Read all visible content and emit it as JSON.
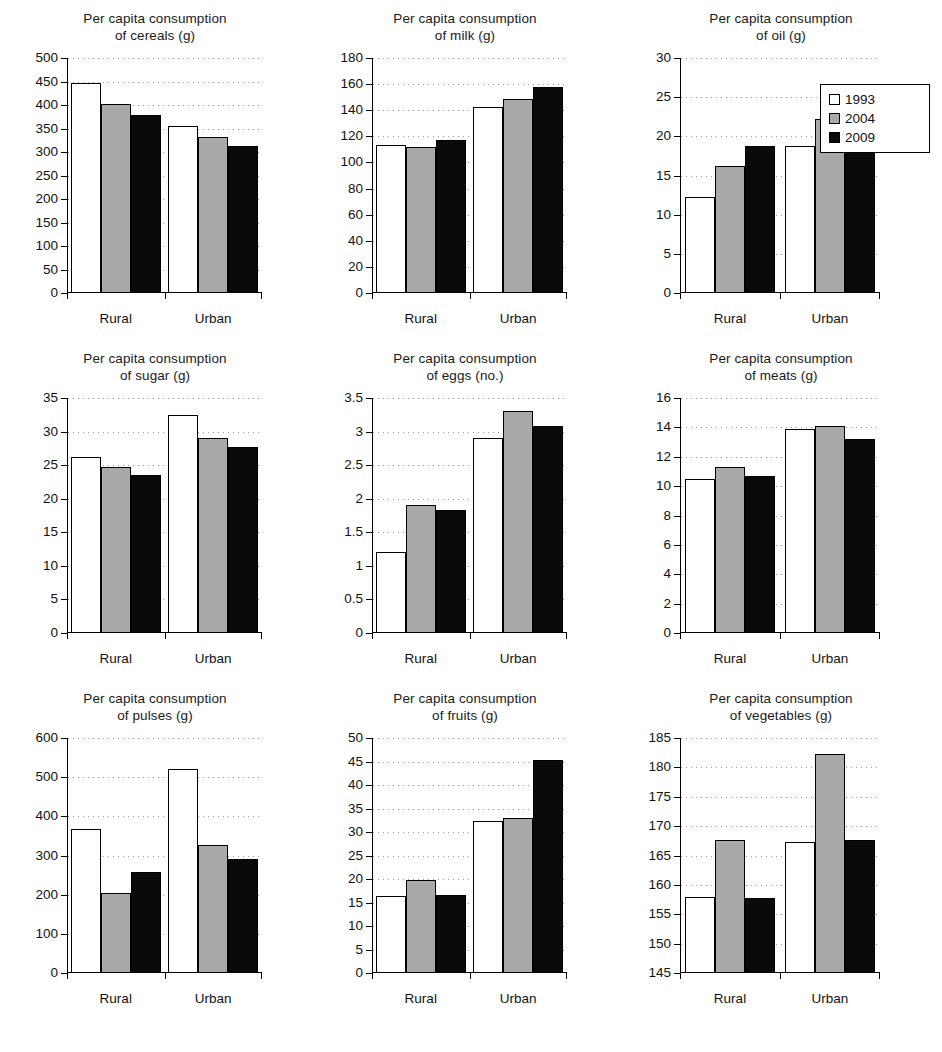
{
  "figure": {
    "series_colors": {
      "1993": "#ffffff",
      "2004": "#a9a9a9",
      "2009": "#0a0a0a"
    },
    "legend": {
      "position": "top-right",
      "entries": [
        {
          "label": "1993",
          "swatch": "white-square"
        },
        {
          "label": "2004",
          "swatch": "gray-square"
        },
        {
          "label": "2009",
          "swatch": "black-square"
        }
      ]
    },
    "caption_partial": "truncated caption text clipped at bottom edge"
  },
  "chart_data": [
    {
      "id": "cereals",
      "type": "bar",
      "title": "Per capita consumption of cereals (g)",
      "title_line1": "Per capita consumption",
      "title_line2": "of cereals (g)",
      "categories": [
        "Rural",
        "Urban"
      ],
      "series": [
        {
          "name": "1993",
          "values": [
            447,
            355
          ]
        },
        {
          "name": "2004",
          "values": [
            403,
            331
          ]
        },
        {
          "name": "2009",
          "values": [
            378,
            313
          ]
        }
      ],
      "ylim": [
        0,
        500
      ],
      "yticks": [
        0,
        50,
        100,
        150,
        200,
        250,
        300,
        350,
        400,
        450,
        500
      ],
      "xlabel": "",
      "ylabel": "",
      "grid": true
    },
    {
      "id": "milk",
      "type": "bar",
      "title": "Per capita consumption of milk (g)",
      "title_line1": "Per capita consumption",
      "title_line2": "of milk (g)",
      "categories": [
        "Rural",
        "Urban"
      ],
      "series": [
        {
          "name": "1993",
          "values": [
            113,
            142.5
          ]
        },
        {
          "name": "2004",
          "values": [
            111.5,
            148.5
          ]
        },
        {
          "name": "2009",
          "values": [
            117.5,
            158
          ]
        }
      ],
      "ylim": [
        0,
        180
      ],
      "yticks": [
        0,
        20,
        40,
        60,
        80,
        100,
        120,
        140,
        160,
        180
      ],
      "xlabel": "",
      "ylabel": "",
      "grid": true
    },
    {
      "id": "oil",
      "type": "bar",
      "title": "Per capita consumption of oil (g)",
      "title_line1": "Per capita consumption",
      "title_line2": "of oil (g)",
      "categories": [
        "Rural",
        "Urban"
      ],
      "series": [
        {
          "name": "1993",
          "values": [
            12.3,
            18.8
          ]
        },
        {
          "name": "2004",
          "values": [
            16.2,
            22.2
          ]
        },
        {
          "name": "2009",
          "values": [
            18.8,
            24.0
          ]
        }
      ],
      "ylim": [
        0,
        30
      ],
      "yticks": [
        0,
        5,
        10,
        15,
        20,
        25,
        30
      ],
      "xlabel": "",
      "ylabel": "",
      "grid": true
    },
    {
      "id": "sugar",
      "type": "bar",
      "title": "Per capita consumption of sugar (g)",
      "title_line1": "Per capita consumption",
      "title_line2": "of sugar (g)",
      "categories": [
        "Rural",
        "Urban"
      ],
      "series": [
        {
          "name": "1993",
          "values": [
            26.2,
            32.4
          ]
        },
        {
          "name": "2004",
          "values": [
            24.7,
            29.0
          ]
        },
        {
          "name": "2009",
          "values": [
            23.5,
            27.7
          ]
        }
      ],
      "ylim": [
        0,
        35
      ],
      "yticks": [
        0,
        5,
        10,
        15,
        20,
        25,
        30,
        35
      ],
      "xlabel": "",
      "ylabel": "",
      "grid": true
    },
    {
      "id": "eggs",
      "type": "bar",
      "title": "Per capita consumption of eggs (no.)",
      "title_line1": "Per capita consumption",
      "title_line2": "of eggs (no.)",
      "categories": [
        "Rural",
        "Urban"
      ],
      "series": [
        {
          "name": "1993",
          "values": [
            1.2,
            2.9
          ]
        },
        {
          "name": "2004",
          "values": [
            1.9,
            3.3
          ]
        },
        {
          "name": "2009",
          "values": [
            1.83,
            3.08
          ]
        }
      ],
      "ylim": [
        0,
        3.5
      ],
      "yticks": [
        0,
        0.5,
        1,
        1.5,
        2,
        2.5,
        3,
        3.5
      ],
      "ytick_labels": [
        "0",
        "0.5",
        "1",
        "1.5",
        "2",
        "2.5",
        "3",
        "3.5"
      ],
      "xlabel": "",
      "ylabel": "",
      "grid": true
    },
    {
      "id": "meats",
      "type": "bar",
      "title": "Per capita consumption of meats (g)",
      "title_line1": "Per capita consumption",
      "title_line2": "of meats (g)",
      "categories": [
        "Rural",
        "Urban"
      ],
      "series": [
        {
          "name": "1993",
          "values": [
            10.5,
            13.9
          ]
        },
        {
          "name": "2004",
          "values": [
            11.3,
            14.1
          ]
        },
        {
          "name": "2009",
          "values": [
            10.7,
            13.2
          ]
        }
      ],
      "ylim": [
        0,
        16
      ],
      "yticks": [
        0,
        2,
        4,
        6,
        8,
        10,
        12,
        14,
        16
      ],
      "xlabel": "",
      "ylabel": "",
      "grid": true
    },
    {
      "id": "pulses",
      "type": "bar",
      "title": "Per capita consumption of pulses (g)",
      "title_line1": "Per capita consumption",
      "title_line2": "of pulses (g)",
      "categories": [
        "Rural",
        "Urban"
      ],
      "series": [
        {
          "name": "1993",
          "values": [
            368,
            521
          ]
        },
        {
          "name": "2004",
          "values": [
            204,
            326
          ]
        },
        {
          "name": "2009",
          "values": [
            257,
            291
          ]
        }
      ],
      "ylim": [
        0,
        600
      ],
      "yticks": [
        0,
        100,
        200,
        300,
        400,
        500,
        600
      ],
      "xlabel": "",
      "ylabel": "",
      "grid": true
    },
    {
      "id": "fruits",
      "type": "bar",
      "title": "Per capita consumption of fruits (g)",
      "title_line1": "Per capita consumption",
      "title_line2": "of fruits (g)",
      "categories": [
        "Rural",
        "Urban"
      ],
      "series": [
        {
          "name": "1993",
          "values": [
            16.3,
            32.4
          ]
        },
        {
          "name": "2004",
          "values": [
            19.7,
            33.0
          ]
        },
        {
          "name": "2009",
          "values": [
            16.5,
            45.3
          ]
        }
      ],
      "ylim": [
        0,
        50
      ],
      "yticks": [
        0,
        5,
        10,
        15,
        20,
        25,
        30,
        35,
        40,
        45,
        50
      ],
      "xlabel": "",
      "ylabel": "",
      "grid": true
    },
    {
      "id": "vegetables",
      "type": "bar",
      "title": "Per capita consumption of vegetables (g)",
      "title_line1": "Per capita consumption",
      "title_line2": "of vegetables (g)",
      "categories": [
        "Rural",
        "Urban"
      ],
      "series": [
        {
          "name": "1993",
          "values": [
            158.0,
            167.3
          ]
        },
        {
          "name": "2004",
          "values": [
            167.7,
            182.3
          ]
        },
        {
          "name": "2009",
          "values": [
            157.7,
            167.7
          ]
        }
      ],
      "ylim": [
        145,
        185
      ],
      "yticks": [
        145,
        150,
        155,
        160,
        165,
        170,
        175,
        180,
        185
      ],
      "xlabel": "",
      "ylabel": "",
      "grid": true
    }
  ]
}
